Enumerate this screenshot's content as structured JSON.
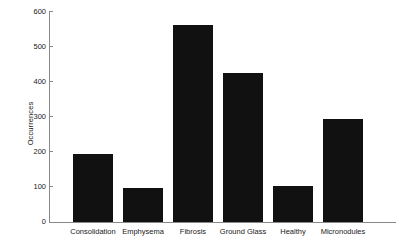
{
  "chart_data": {
    "type": "bar",
    "title": "",
    "xlabel": "",
    "ylabel": "Occurrences",
    "categories": [
      "Consolidation",
      "Emphysema",
      "Fibrosis",
      "Ground Glass",
      "Healthy",
      "Micronodules"
    ],
    "values": [
      193,
      96,
      563,
      426,
      104,
      294
    ],
    "ylim": [
      0,
      600
    ],
    "yticks": [
      0,
      100,
      200,
      300,
      400,
      500,
      600
    ],
    "ytick_labels": [
      "0",
      "100",
      "200",
      "300",
      "400",
      "500",
      "600"
    ],
    "grid": false,
    "legend": null,
    "bar_color": "#111111",
    "axis_color": "#8a8a8a",
    "text_color": "#1a1a1a",
    "background_color": "#ffffff"
  }
}
